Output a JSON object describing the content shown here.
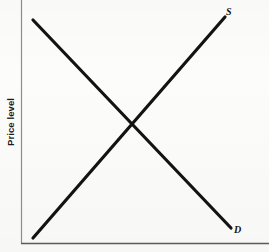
{
  "figure": {
    "background_color": "#fcfcfb",
    "ink_color": "#131313",
    "axis_color": "#8c8c8c"
  },
  "axes": {
    "y_label": "Price level",
    "x_label": "",
    "origin": {
      "x": 21,
      "y": 243
    },
    "y_axis_top": 0,
    "x_axis_right": 269
  },
  "labels": {
    "supply": "S",
    "demand": "D"
  },
  "chart_data": {
    "type": "line",
    "title": "",
    "subtitle": "",
    "xlabel": "",
    "ylabel": "Price level",
    "xlim": [
      0,
      100
    ],
    "ylim": [
      0,
      100
    ],
    "grid": false,
    "legend": "inline-curve-labels",
    "axis_ticks": {
      "x": [],
      "y": []
    },
    "series": [
      {
        "name": "S",
        "label": "S",
        "description": "Upward-sloping aggregate supply curve",
        "x": [
          6,
          100
        ],
        "y": [
          2,
          94
        ],
        "color": "#131313",
        "line_width": 3.2,
        "label_position": {
          "x": 228,
          "y": 12
        }
      },
      {
        "name": "D",
        "label": "D",
        "description": "Downward-sloping aggregate demand curve",
        "x": [
          6,
          100
        ],
        "y": [
          92,
          6
        ],
        "color": "#131313",
        "line_width": 3.2,
        "label_position": {
          "x": 237,
          "y": 231
        }
      }
    ],
    "annotations": [
      {
        "name": "equilibrium-intersection",
        "text": "",
        "x": 53,
        "y": 49,
        "pixel": {
          "x": 133,
          "y": 124
        }
      }
    ]
  },
  "geometry": {
    "supply_line": {
      "x1": 33,
      "y1": 238,
      "x2": 225,
      "y2": 17
    },
    "demand_line": {
      "x1": 33,
      "y1": 20,
      "x2": 231,
      "y2": 228
    }
  }
}
